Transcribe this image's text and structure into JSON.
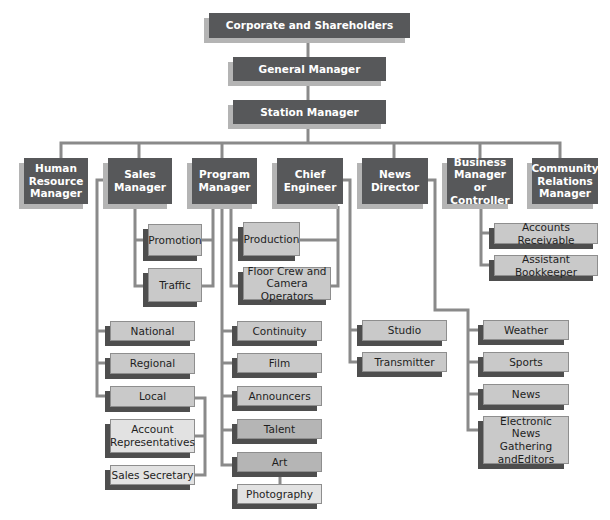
{
  "colors": {
    "executive_box": "#57585a",
    "executive_text": "#ffffff",
    "department_box": "#c9c9c9",
    "department_box_dark": "#b5b5b5",
    "department_box_pale": "#e2e2e2",
    "connector": "#8a8a8a"
  },
  "top": {
    "corporate": "Corporate and Shareholders",
    "general_manager": "General Manager",
    "station_manager": "Station Manager"
  },
  "managers": [
    {
      "label": "Human Resource Manager"
    },
    {
      "label": "Sales Manager"
    },
    {
      "label": "Program Manager"
    },
    {
      "label": "Chief Engineer"
    },
    {
      "label": "News Director"
    },
    {
      "label": "Business Manager or Controller"
    },
    {
      "label": "Community Relations Manager"
    }
  ],
  "shared": {
    "promotion": "Promotion",
    "traffic": "Traffic",
    "production": "Production",
    "floor_crew": "Floor Crew and Camera Operators"
  },
  "sales": {
    "national": "National",
    "regional": "Regional",
    "local": "Local",
    "account_reps": "Account Representatives",
    "sales_secretary": "Sales Secretary"
  },
  "program": {
    "continuity": "Continuity",
    "film": "Film",
    "announcers": "Announcers",
    "talent": "Talent",
    "art": "Art",
    "photography": "Photography"
  },
  "engineering": {
    "studio": "Studio",
    "transmitter": "Transmitter"
  },
  "news": {
    "weather": "Weather",
    "sports": "Sports",
    "news": "News",
    "eng": "Electronic News Gathering andEditors"
  },
  "business": {
    "accounts_receivable": "Accounts Receivable",
    "assistant_bookkeeper": "Assistant Bookkeeper"
  }
}
